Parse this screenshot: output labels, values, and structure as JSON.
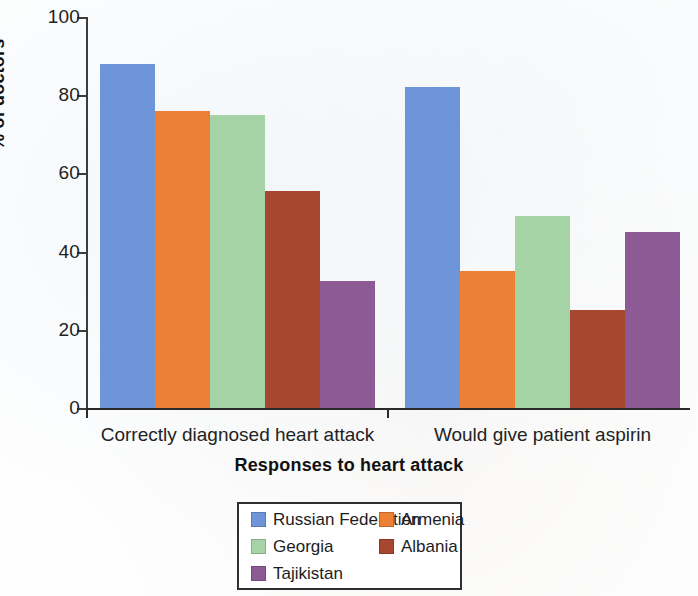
{
  "chart_data": {
    "type": "bar",
    "title": "",
    "xlabel": "Responses to heart attack",
    "ylabel": "% of doctors",
    "categories": [
      "Correctly diagnosed heart attack",
      "Would give patient aspirin"
    ],
    "ylim": [
      0,
      100
    ],
    "yticks": [
      0,
      20,
      40,
      60,
      80,
      100
    ],
    "ytick_labels": [
      "0",
      "20",
      "40",
      "60",
      "80",
      "100"
    ],
    "grid": false,
    "legend_position": "bottom-center",
    "series": [
      {
        "name": "Russian Federation",
        "color": "#6e95d7",
        "values": [
          88,
          82
        ]
      },
      {
        "name": "Armenia",
        "color": "#ec8034",
        "values": [
          76,
          35
        ]
      },
      {
        "name": "Georgia",
        "color": "#a6d3a6",
        "values": [
          75,
          49
        ]
      },
      {
        "name": "Albania",
        "color": "#a7472f",
        "values": [
          55.5,
          25
        ]
      },
      {
        "name": "Tajikistan",
        "color": "#8e5a96",
        "values": [
          32.5,
          45
        ]
      }
    ]
  },
  "legend": {
    "rows": [
      [
        "Russian Federation",
        "Armenia"
      ],
      [
        "Georgia",
        "Albania"
      ],
      [
        "Tajikistan",
        ""
      ]
    ]
  }
}
